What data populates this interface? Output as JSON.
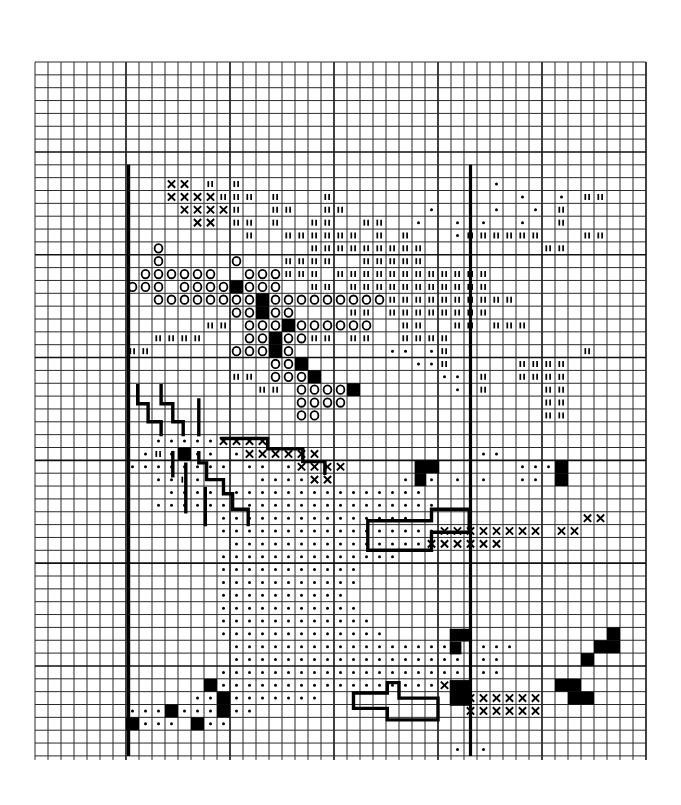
{
  "pattern": {
    "title": "Cross-stitch chart",
    "grid": {
      "origin_x": 35,
      "origin_y": 62,
      "cell_w": 13.0,
      "cell_h": 12.85,
      "cols": 47,
      "rows": 54,
      "major_every": 8,
      "major_col_offset": 7,
      "major_row_offset": 7,
      "tick_extension": 4,
      "line_color": "#2a2a2a"
    },
    "borders": {
      "left_col": 7.2,
      "right_col": 33.5,
      "top_row": 8.0,
      "bottom_row": 54.0
    },
    "legend": {
      "x": "cross stitch",
      "o": "circle stitch",
      "t": "tick stitch (double vertical)",
      "d": "dot stitch",
      "f": "filled square",
      "-": "empty"
    },
    "row_start_col": 7,
    "rows_data": [
      {
        "r": 9,
        "s": "---xx-t-t-----------------d-d---------"
      },
      {
        "r": 10,
        "s": "---xxxxttt-t---t--------------d--d-tt--"
      },
      {
        "r": 11,
        "s": "----xxxxt--tt--tt------d--d-d--d-t-----"
      },
      {
        "r": 12,
        "s": "-----xx-tt-t--tt--tt--d--d-d--d--t-----"
      },
      {
        "r": 13,
        "s": "---------t--tttttt-t-t---dtttttt---tt---"
      },
      {
        "r": 14,
        "s": "--o-----------ttttttttt---------tt-----"
      },
      {
        "r": 15,
        "s": "--o-----o---tttt--ttttt---------------"
      },
      {
        "r": 16,
        "s": "-oooooo--ooottt-tttttttttttt-----------"
      },
      {
        "r": 17,
        "s": "ooo-oooofooo--tt-ttttttttttt----------"
      },
      {
        "r": 18,
        "s": "--oooooooofoooooooootttttttttt--------"
      },
      {
        "r": 19,
        "s": "--------oofoo----tt-tttttttt----------"
      },
      {
        "r": 20,
        "s": "------tt-ooofoooooo--tt--tt-ttt-------"
      },
      {
        "r": 21,
        "s": "--tttt---oofoott-tt--tttt-------------"
      },
      {
        "r": 22,
        "s": "tt------ooofo-------dd-dt----------t--"
      },
      {
        "r": 23,
        "s": "-----------oof--------ddt-----tttt----"
      },
      {
        "r": 24,
        "s": "--------tt-ooof---------dddt--tttt----"
      },
      {
        "r": 25,
        "s": "----------tt-oooof-------ddt----tt----"
      },
      {
        "r": 26,
        "s": "-------------oooo---------d-----tt----"
      },
      {
        "r": 27,
        "s": "-------------oo-----------------tt----"
      },
      {
        "r": 28,
        "s": "--------------------------------------"
      },
      {
        "r": 29,
        "s": "--dddddxxxx---------------------------"
      },
      {
        "r": 30,
        "s": "-dtdfdd-dxxxxxx------------dd---------"
      },
      {
        "r": 31,
        "s": "dddddddd-dd-dxxxx-------------dddf----"
      },
      {
        "r": 32,
        "s": "--ddtddd--ddddxx-----d-d-d-d--dd-f----"
      },
      {
        "r": 33,
        "s": "---dddddddddddddddddddd---------------"
      },
      {
        "r": 34,
        "s": "--dddddd-ddddddddddddddd--------------"
      },
      {
        "r": 35,
        "s": "-------ddddddddddddddd-------------xx-"
      },
      {
        "r": 36,
        "s": "-------dddddddddddddddddxxxxxxxx-xx--"
      },
      {
        "r": 37,
        "s": "--------dddddddddddddddxxxxxx---------"
      },
      {
        "r": 38,
        "s": "-------dddddddddddddd------------------"
      },
      {
        "r": 39,
        "s": "-------ddddddddddd--------------------"
      },
      {
        "r": 40,
        "s": "-------ddddddddddd--------------------"
      },
      {
        "r": 41,
        "s": "-------dddddddddd---------------------"
      },
      {
        "r": 42,
        "s": "-------ddddddddddd-------------------"
      },
      {
        "r": 43,
        "s": "-------dddddddddddd------------------"
      },
      {
        "r": 44,
        "s": "-------ddddddddddddd-----------------f"
      },
      {
        "r": 45,
        "s": "--------dddddddddddddddddddddd------ff"
      },
      {
        "r": 46,
        "s": "--------ddddddddddddddddddddd------f-"
      },
      {
        "r": 47,
        "s": "-------dddddddddddddddddddddd--------"
      },
      {
        "r": 48,
        "s": "------fdddddddddddddddddxd-------ff-"
      },
      {
        "r": 49,
        "s": "-----ddfddddddd----------xxxxxxx--ff-"
      },
      {
        "r": 50,
        "s": "dddfdddfdd----------------xxxxxx-----"
      },
      {
        "r": 51,
        "s": "fddd-fdd------------------------------"
      },
      {
        "r": 53,
        "s": "-------------------------ddd---------"
      }
    ],
    "backstitch": [
      {
        "name": "lightning-left",
        "pts": [
          [
            7.9,
            25.2
          ],
          [
            7.9,
            26.6
          ],
          [
            8.7,
            26.6
          ],
          [
            8.7,
            28.0
          ],
          [
            9.7,
            28.0
          ],
          [
            9.7,
            29.0
          ]
        ]
      },
      {
        "name": "lightning-mid",
        "pts": [
          [
            9.7,
            25.2
          ],
          [
            9.7,
            26.6
          ],
          [
            10.6,
            26.6
          ],
          [
            10.6,
            28.0
          ],
          [
            11.4,
            28.0
          ],
          [
            11.4,
            29.0
          ]
        ]
      },
      {
        "name": "lightning-right",
        "pts": [
          [
            12.6,
            26.3
          ],
          [
            12.6,
            29.0
          ]
        ]
      },
      {
        "name": "sleeve-lower-left",
        "pts": [
          [
            10.6,
            30.4
          ],
          [
            10.6,
            32.2
          ]
        ]
      },
      {
        "name": "sleeve-lower-left-2",
        "pts": [
          [
            11.6,
            31.3
          ],
          [
            11.6,
            35.0
          ]
        ]
      },
      {
        "name": "sleeve-step",
        "pts": [
          [
            12.6,
            30.4
          ],
          [
            12.6,
            31.2
          ],
          [
            13.2,
            31.2
          ],
          [
            13.2,
            32.5
          ],
          [
            14.5,
            32.5
          ],
          [
            14.5,
            33.6
          ],
          [
            15.2,
            33.6
          ],
          [
            15.2,
            34.8
          ],
          [
            16.4,
            34.8
          ],
          [
            16.4,
            36.0
          ]
        ]
      },
      {
        "name": "sleeve-step-b",
        "pts": [
          [
            13.1,
            33.2
          ],
          [
            13.1,
            36.0
          ]
        ]
      },
      {
        "name": "collar-outline",
        "pts": [
          [
            14.4,
            29.3
          ],
          [
            17.9,
            29.3
          ],
          [
            17.9,
            30.1
          ],
          [
            20.6,
            30.1
          ],
          [
            20.6,
            31.1
          ],
          [
            22.3,
            31.1
          ],
          [
            22.3,
            32.0
          ]
        ]
      },
      {
        "name": "cuff-right-outline",
        "pts": [
          [
            25.6,
            37.1
          ],
          [
            25.6,
            35.7
          ],
          [
            30.5,
            35.7
          ],
          [
            30.5,
            34.8
          ],
          [
            33.4,
            34.8
          ],
          [
            33.4,
            36.6
          ],
          [
            30.5,
            36.6
          ],
          [
            30.5,
            38.0
          ],
          [
            25.6,
            38.0
          ],
          [
            25.6,
            37.1
          ]
        ]
      },
      {
        "name": "cuff-lower-outline",
        "pts": [
          [
            24.5,
            50.3
          ],
          [
            24.5,
            49.1
          ],
          [
            27.1,
            49.1
          ],
          [
            27.1,
            48.3
          ],
          [
            28.0,
            48.3
          ],
          [
            28.0,
            49.5
          ],
          [
            31.0,
            49.5
          ],
          [
            31.0,
            51.2
          ],
          [
            27.1,
            51.2
          ],
          [
            27.1,
            50.3
          ],
          [
            24.5,
            50.3
          ]
        ]
      }
    ],
    "fill_blocks": [
      {
        "name": "fill-upper-right",
        "x": 29.2,
        "y": 31.0,
        "w": 1.9,
        "h": 1.0
      },
      {
        "name": "fill-upper-right-b",
        "x": 29.2,
        "y": 32.0,
        "w": 0.9,
        "h": 1.0
      },
      {
        "name": "fill-right-1",
        "x": 31.9,
        "y": 44.1,
        "w": 1.6,
        "h": 1.0
      },
      {
        "name": "fill-right-2",
        "x": 31.9,
        "y": 45.1,
        "w": 0.9,
        "h": 1.0
      },
      {
        "name": "fill-right-3",
        "x": 31.9,
        "y": 48.1,
        "w": 1.6,
        "h": 2.0
      }
    ]
  }
}
